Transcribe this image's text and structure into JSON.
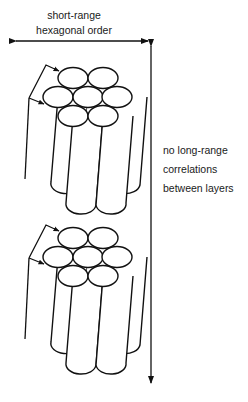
{
  "labels": {
    "top": [
      "short-range",
      "hexagonal order"
    ],
    "side": [
      "no long-range",
      "correlations",
      "between layers"
    ]
  },
  "figure": {
    "bundles": 2,
    "cylinders_per_bundle": 7,
    "stroke_color": "#111111",
    "fill_color": "#ffffff"
  },
  "arrows": {
    "horizontal": "short-range hexagonal order (double-headed)",
    "vertical": "no long-range correlations between layers (double-headed)"
  }
}
